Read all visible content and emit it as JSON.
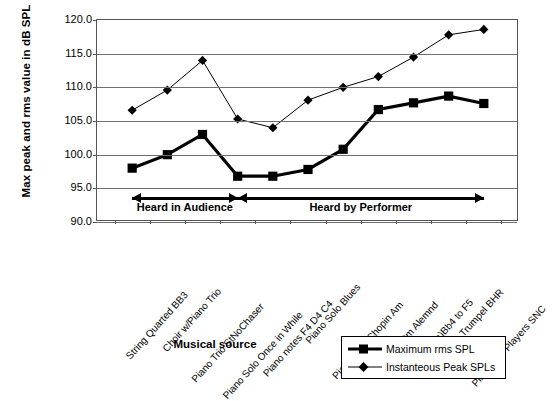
{
  "chart_data": {
    "type": "line",
    "title": "",
    "xlabel": "Musical source",
    "ylabel": "Max peak and rms value in dB SPL",
    "ylim": [
      90.0,
      120.0
    ],
    "ytick_step": 5.0,
    "ytick_labels": [
      "120.0",
      "115.0",
      "110.0",
      "105.0",
      "100.0",
      "95.0",
      "90.0"
    ],
    "ytick_values": [
      120.0,
      115.0,
      110.0,
      105.0,
      100.0,
      95.0,
      90.0
    ],
    "grid": true,
    "legend_position": "bottom-right",
    "categories": [
      "String Quarted BB3",
      "Choir w/Piano Trio",
      "Piano Trio StNoChaser",
      "Piano Solo Once in While",
      "Piano notes F4 D4 C4",
      "Piano Solo Blues",
      "Piano Solo Chopin Am",
      "Solo violin Dm Alemnd",
      "Voice(LaLa)Bb4 to F5",
      "Solo Trumpel BHR",
      "Piano Trio Players SNC"
    ],
    "series": [
      {
        "name": "Maximum rms SPL",
        "marker": "square",
        "line_width": "thick",
        "color": "#000000",
        "values": [
          98.0,
          100.0,
          103.0,
          96.8,
          96.8,
          97.8,
          100.8,
          106.7,
          107.7,
          108.7,
          107.6
        ]
      },
      {
        "name": "Instanteous Peak SPLs",
        "marker": "diamond",
        "line_width": "thin",
        "color": "#000000",
        "values": [
          106.6,
          109.6,
          114.0,
          105.3,
          104.0,
          108.1,
          110.0,
          111.6,
          114.5,
          117.8,
          118.6
        ]
      }
    ],
    "annotations": [
      {
        "label": "Heard in Audience",
        "from_index": 0,
        "to_index": 3,
        "arrows": "both",
        "y_value": 93.7
      },
      {
        "label": "Heard by Performer",
        "from_index": 3,
        "to_index": 10,
        "arrows": "both",
        "y_value": 93.7
      }
    ]
  },
  "legend": {
    "items": [
      {
        "label": "Maximum rms SPL"
      },
      {
        "label": "Instanteous Peak SPLs"
      }
    ]
  },
  "caption": {
    "text": ""
  }
}
